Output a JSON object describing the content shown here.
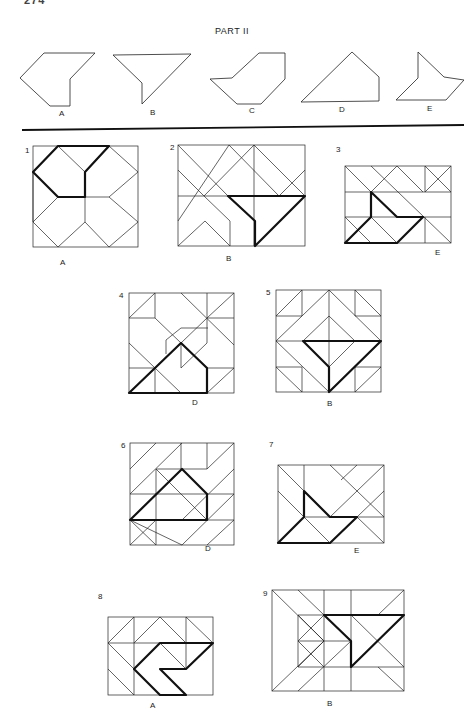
{
  "page": {
    "page_number": "274",
    "section_title": "PART II"
  },
  "options": [
    {
      "letter": "A",
      "label_pos": [
        62,
        112
      ]
    },
    {
      "letter": "B",
      "label_pos": [
        152,
        110
      ]
    },
    {
      "letter": "C",
      "label_pos": [
        251,
        108
      ]
    },
    {
      "letter": "D",
      "label_pos": [
        341,
        107
      ]
    },
    {
      "letter": "E",
      "label_pos": [
        429,
        106
      ]
    }
  ],
  "problems": [
    {
      "number": "1",
      "answer": "A"
    },
    {
      "number": "2",
      "answer": "B"
    },
    {
      "number": "3",
      "answer": "E"
    },
    {
      "number": "4",
      "answer": "D"
    },
    {
      "number": "5",
      "answer": "B"
    },
    {
      "number": "6",
      "answer": "D"
    },
    {
      "number": "7",
      "answer": "E"
    },
    {
      "number": "8",
      "answer": "A"
    },
    {
      "number": "9",
      "answer": "B"
    }
  ]
}
